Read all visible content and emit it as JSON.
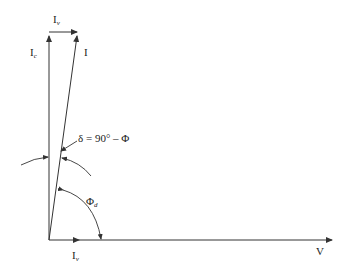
{
  "diagram": {
    "type": "phasor-diagram",
    "colors": {
      "line": "#333333",
      "text": "#222222",
      "background": "#ffffff"
    },
    "labels": {
      "ic_main": "I",
      "ic_sub": "c",
      "iv_top_main": "I",
      "iv_top_sub": "v",
      "i_main": "I",
      "delta_eq": "δ = 90° – Φ",
      "phi_main": "Φ",
      "phi_sub": "d",
      "iv_bottom_main": "I",
      "iv_bottom_sub": "v",
      "v": "V"
    },
    "phasors": [
      {
        "name": "Ic",
        "from": [
          49,
          240
        ],
        "to": [
          49,
          36
        ]
      },
      {
        "name": "I",
        "from": [
          49,
          240
        ],
        "to": [
          77,
          36
        ]
      },
      {
        "name": "Iv-top",
        "from": [
          49,
          32
        ],
        "to": [
          77,
          32
        ]
      },
      {
        "name": "V",
        "from": [
          49,
          240
        ],
        "to": [
          332,
          240
        ]
      }
    ],
    "angles": [
      {
        "name": "delta",
        "label": "δ = 90° – Φ",
        "between": [
          "Ic",
          "I"
        ]
      },
      {
        "name": "phi_d",
        "label": "Φd",
        "between": [
          "I",
          "V"
        ]
      }
    ]
  }
}
